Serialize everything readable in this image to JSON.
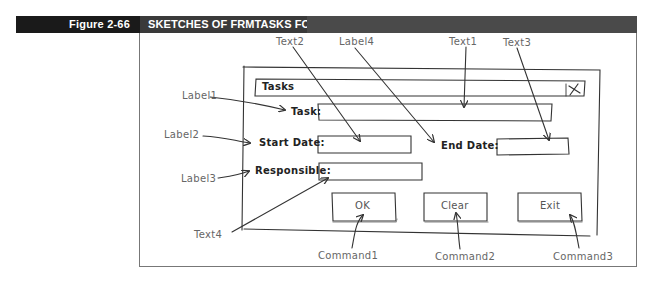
{
  "figure": {
    "number": "Figure 2-66",
    "title": "SKETCHES OF FRMTASKS FORM"
  },
  "form_sketch": {
    "title_bar": "Tasks",
    "close_glyph": "X",
    "labels": {
      "task": "Task:",
      "start_date": "Start Date:",
      "end_date": "End Date:",
      "responsible": "Responsible:"
    },
    "buttons": {
      "ok": "OK",
      "clear": "Clear",
      "exit": "Exit"
    }
  },
  "annotations": {
    "label1": "Label1",
    "label2": "Label2",
    "label3": "Label3",
    "label4": "Label4",
    "text1": "Text1",
    "text2": "Text2",
    "text3": "Text3",
    "text4": "Text4",
    "command1": "Command1",
    "command2": "Command2",
    "command3": "Command3"
  },
  "colors": {
    "figure_label_bg": "#1a1a1a",
    "title_bg": "#3a3a3a",
    "sketch_line": "#333333",
    "annotation_text": "#666666"
  }
}
